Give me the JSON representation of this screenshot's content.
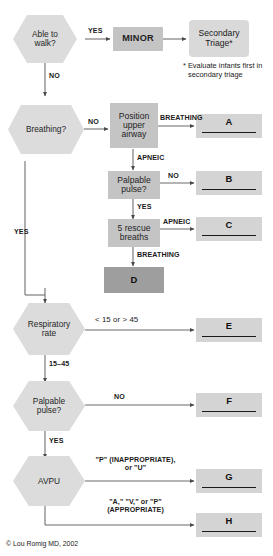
{
  "diagram": {
    "credit": "© Lou Romig MD, 2002",
    "footnote": "* Evaluate infants first in\nsecondary triage",
    "footnote_line1": "* Evaluate infants first in",
    "footnote_line2": "secondary triage",
    "colors": {
      "hexagon_fill": "#dcdcdc",
      "process_fill": "#c4c4c4",
      "rounded_fill": "#d9d9d9",
      "outcome_fill": "#d4d4d4",
      "outcome_dark_fill": "#9e9e9e",
      "line": "#4a4a4a",
      "text": "#1a1a1a",
      "background": "#ffffff"
    }
  },
  "nodes": {
    "able_to_walk": {
      "line1": "Able to",
      "line2": "walk?"
    },
    "minor": {
      "label": "MINOR"
    },
    "secondary_triage": {
      "line1": "Secondary",
      "line2": "Triage*"
    },
    "breathing": {
      "label": "Breathing?"
    },
    "position_upper_airway": {
      "line1": "Position",
      "line2": "upper",
      "line3": "airway"
    },
    "palpable_pulse_1": {
      "line1": "Palpable",
      "line2": "pulse?"
    },
    "five_rescue_breaths": {
      "line1": "5 rescue",
      "line2": "breaths"
    },
    "respiratory_rate": {
      "line1": "Respiratory",
      "line2": "rate"
    },
    "palpable_pulse_2": {
      "line1": "Palpable",
      "line2": "pulse?"
    },
    "avpu": {
      "label": "AVPU"
    }
  },
  "outcomes": {
    "a": {
      "letter": "A"
    },
    "b": {
      "letter": "B"
    },
    "c": {
      "letter": "C"
    },
    "d": {
      "letter": "D"
    },
    "e": {
      "letter": "E"
    },
    "f": {
      "letter": "F"
    },
    "g": {
      "letter": "G"
    },
    "h": {
      "letter": "H"
    }
  },
  "edges": {
    "walk_yes": "YES",
    "walk_no": "NO",
    "breathing_no": "NO",
    "breathing_yes": "YES",
    "airway_breathing": "BREATHING",
    "airway_apneic": "APNEIC",
    "pulse1_no": "NO",
    "pulse1_yes": "YES",
    "breaths_apneic": "APNEIC",
    "breaths_breathing": "BREATHING",
    "resp_out_of_range": "< 15 or > 45",
    "resp_in_range": "15–45",
    "pulse2_no": "NO",
    "pulse2_yes": "YES",
    "avpu_pu_line1": "\"P\" (INAPPROPRIATE),",
    "avpu_pu_line2": "or \"U\"",
    "avpu_avp_line1": "\"A,\" \"V,\" or \"P\"",
    "avpu_avp_line2": "(APPROPRIATE)"
  }
}
